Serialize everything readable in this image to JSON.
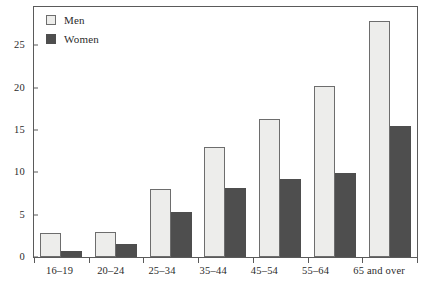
{
  "chart_data": {
    "type": "bar",
    "title": "",
    "subtitle": "",
    "xlabel": "",
    "ylabel": "",
    "categories": [
      "16–19",
      "20–24",
      "25–34",
      "35–44",
      "45–54",
      "55–64",
      "65 and over"
    ],
    "series": [
      {
        "name": "Men",
        "values": [
          2.8,
          2.9,
          8.0,
          13.0,
          16.3,
          20.2,
          27.8
        ],
        "color": "#ededeb",
        "border_color": "#6d6d6d"
      },
      {
        "name": "Women",
        "values": [
          0.7,
          1.5,
          5.3,
          8.1,
          9.2,
          9.9,
          15.5
        ],
        "color": "#4e4e4e",
        "border_color": "#4e4e4e"
      }
    ],
    "ylim": [
      0,
      29.5
    ],
    "yticks": [
      0,
      5,
      10,
      15,
      20,
      25
    ],
    "ytick_labels": [
      "0",
      "5",
      "10",
      "15",
      "20",
      "25"
    ],
    "grid": false,
    "legend_position": "top-left",
    "frame": true
  },
  "legend": {
    "entries": [
      {
        "label": "Men",
        "swatch": "light-square-swatch"
      },
      {
        "label": "Women",
        "swatch": "dark-square-swatch"
      }
    ]
  }
}
